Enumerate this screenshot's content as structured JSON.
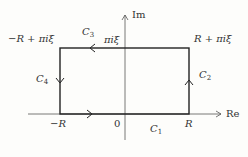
{
  "diagram": {
    "axes": {
      "real_label": "Re",
      "imag_label": "Im",
      "origin_label": "0"
    },
    "vertices": {
      "bottom_left": "−R",
      "bottom_right": "R",
      "top_right": "R + πiξ",
      "top_left": "−R + πiξ",
      "top_axis": "πiξ"
    },
    "segments": [
      {
        "name": "C",
        "sub": "1",
        "direction": "right"
      },
      {
        "name": "C",
        "sub": "2",
        "direction": "up"
      },
      {
        "name": "C",
        "sub": "3",
        "direction": "left"
      },
      {
        "name": "C",
        "sub": "4",
        "direction": "down"
      }
    ],
    "colors": {
      "line": "#222222",
      "axis": "#555555",
      "text": "#333333"
    }
  }
}
